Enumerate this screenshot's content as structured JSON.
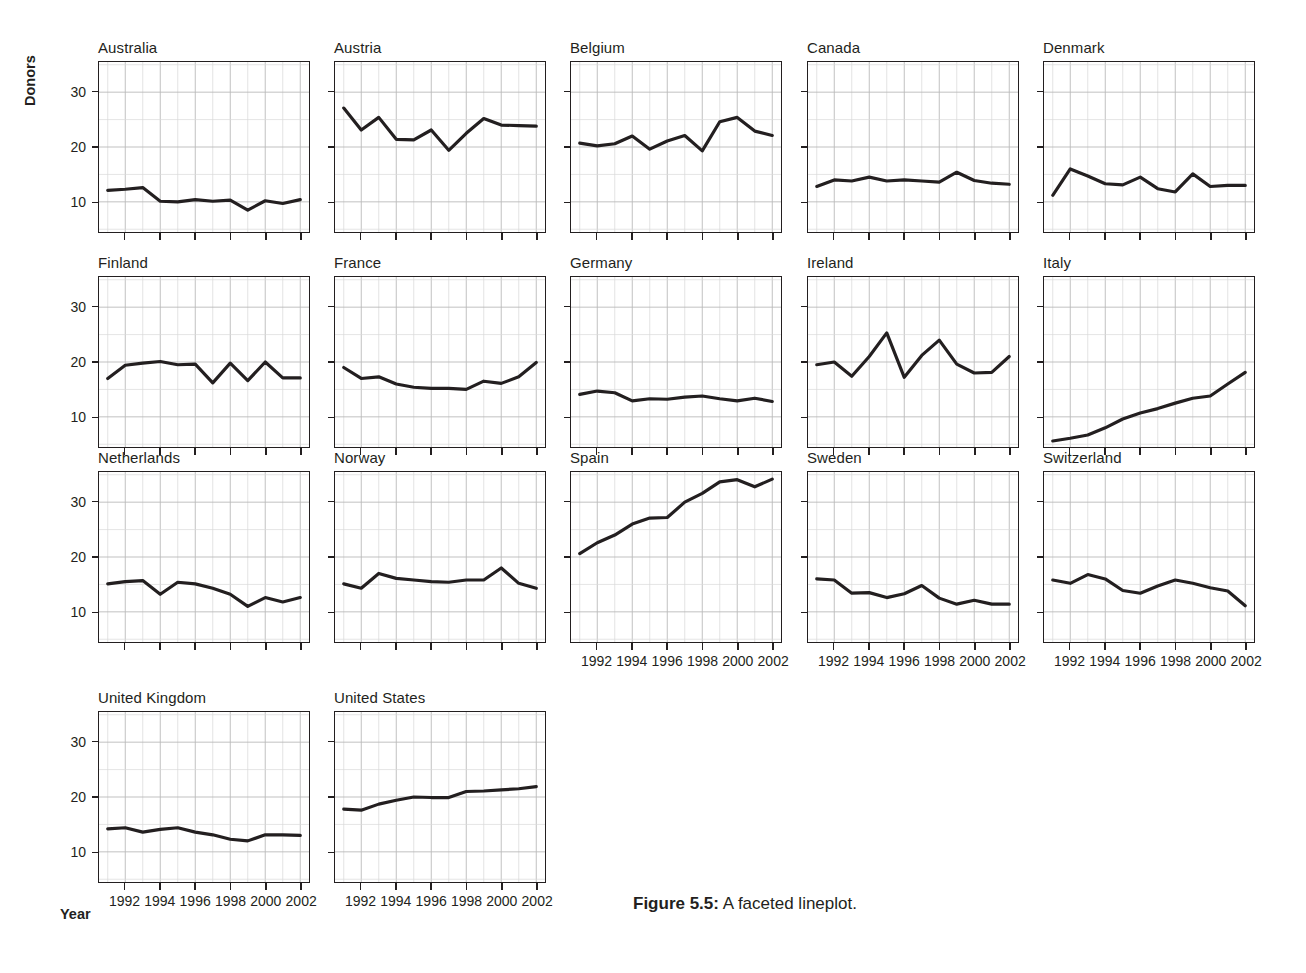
{
  "figure": {
    "caption_label": "Figure 5.5:",
    "caption_text": " A faceted lineplot.",
    "y_axis_title": "Donors",
    "x_axis_title": "Year"
  },
  "chart_data": {
    "type": "line",
    "title": "",
    "xlabel": "Year",
    "ylabel": "Donors",
    "xlim": [
      1990.5,
      2002.5
    ],
    "ylim": [
      4.5,
      35.5
    ],
    "xticks": [
      1992,
      1994,
      1996,
      1998,
      2000,
      2002
    ],
    "xtick_labels": [
      "1992",
      "1994",
      "1996",
      "1998",
      "2000",
      "2002"
    ],
    "yticks": [
      10,
      20,
      30
    ],
    "ytick_labels": [
      "10",
      "20",
      "30"
    ],
    "grid": true,
    "grid_minor_x": true,
    "legend": "none",
    "line_color": "#231f20",
    "line_width": 3.2,
    "facet_variable": "country",
    "facet_columns": 5,
    "facet_rows": 4,
    "x": [
      1991,
      1992,
      1993,
      1994,
      1995,
      1996,
      1997,
      1998,
      1999,
      2000,
      2001,
      2002
    ],
    "series": [
      {
        "name": "Australia",
        "row": 0,
        "col": 0,
        "values": [
          12.1,
          12.3,
          12.6,
          10.1,
          10.0,
          10.4,
          10.1,
          10.3,
          8.5,
          10.2,
          9.7,
          10.4
        ]
      },
      {
        "name": "Austria",
        "row": 0,
        "col": 1,
        "values": [
          27.1,
          23.1,
          25.4,
          21.4,
          21.3,
          23.1,
          19.4,
          22.5,
          25.2,
          24.0,
          23.9,
          23.8
        ]
      },
      {
        "name": "Belgium",
        "row": 0,
        "col": 2,
        "values": [
          20.7,
          20.2,
          20.6,
          22.0,
          19.6,
          21.1,
          22.1,
          19.3,
          24.6,
          25.4,
          22.9,
          22.1
        ]
      },
      {
        "name": "Canada",
        "row": 0,
        "col": 3,
        "values": [
          12.8,
          14.0,
          13.8,
          14.5,
          13.8,
          14.0,
          13.8,
          13.6,
          15.4,
          13.9,
          13.4,
          13.2
        ]
      },
      {
        "name": "Denmark",
        "row": 0,
        "col": 4,
        "values": [
          11.2,
          16.0,
          14.7,
          13.3,
          13.1,
          14.5,
          12.4,
          11.8,
          15.1,
          12.8,
          13.0,
          13.0
        ]
      },
      {
        "name": "Finland",
        "row": 1,
        "col": 0,
        "values": [
          17.0,
          19.4,
          19.8,
          20.1,
          19.5,
          19.6,
          16.2,
          19.8,
          16.6,
          20.0,
          17.1,
          17.1
        ]
      },
      {
        "name": "France",
        "row": 1,
        "col": 1,
        "values": [
          19.0,
          17.0,
          17.3,
          16.0,
          15.4,
          15.2,
          15.2,
          15.0,
          16.5,
          16.1,
          17.3,
          19.9
        ]
      },
      {
        "name": "Germany",
        "row": 1,
        "col": 2,
        "values": [
          14.1,
          14.7,
          14.4,
          12.9,
          13.3,
          13.2,
          13.6,
          13.8,
          13.3,
          12.9,
          13.4,
          12.8
        ]
      },
      {
        "name": "Ireland",
        "row": 1,
        "col": 3,
        "values": [
          19.5,
          20.0,
          17.4,
          21.0,
          25.3,
          17.2,
          21.2,
          24.0,
          19.6,
          18.0,
          18.1,
          21.0
        ]
      },
      {
        "name": "Italy",
        "row": 1,
        "col": 4,
        "values": [
          5.6,
          6.1,
          6.7,
          8.0,
          9.6,
          10.7,
          11.5,
          12.5,
          13.4,
          13.8,
          16.0,
          18.1
        ]
      },
      {
        "name": "Netherlands",
        "row": 2,
        "col": 0,
        "values": [
          15.1,
          15.5,
          15.7,
          13.2,
          15.4,
          15.1,
          14.3,
          13.2,
          11.0,
          12.6,
          11.8,
          12.6
        ]
      },
      {
        "name": "Norway",
        "row": 2,
        "col": 1,
        "values": [
          15.1,
          14.3,
          17.0,
          16.1,
          15.8,
          15.5,
          15.4,
          15.8,
          15.8,
          18.0,
          15.2,
          14.3
        ]
      },
      {
        "name": "Spain",
        "row": 2,
        "col": 2,
        "values": [
          20.6,
          22.6,
          24.0,
          26.0,
          27.1,
          27.2,
          30.0,
          31.6,
          33.7,
          34.1,
          32.8,
          34.2
        ]
      },
      {
        "name": "Sweden",
        "row": 2,
        "col": 3,
        "values": [
          16.0,
          15.8,
          13.4,
          13.5,
          12.6,
          13.3,
          14.8,
          12.5,
          11.4,
          12.1,
          11.4,
          11.4
        ]
      },
      {
        "name": "Switzerland",
        "row": 2,
        "col": 4,
        "values": [
          15.8,
          15.2,
          16.8,
          16.0,
          13.9,
          13.4,
          14.7,
          15.8,
          15.2,
          14.4,
          13.8,
          11.1
        ]
      },
      {
        "name": "United Kingdom",
        "row": 3,
        "col": 0,
        "values": [
          14.2,
          14.4,
          13.6,
          14.1,
          14.4,
          13.6,
          13.1,
          12.3,
          12.0,
          13.1,
          13.1,
          13.0
        ]
      },
      {
        "name": "United States",
        "row": 3,
        "col": 1,
        "values": [
          17.8,
          17.6,
          18.7,
          19.4,
          20.0,
          19.9,
          19.9,
          21.0,
          21.1,
          21.3,
          21.5,
          21.9
        ]
      }
    ]
  }
}
